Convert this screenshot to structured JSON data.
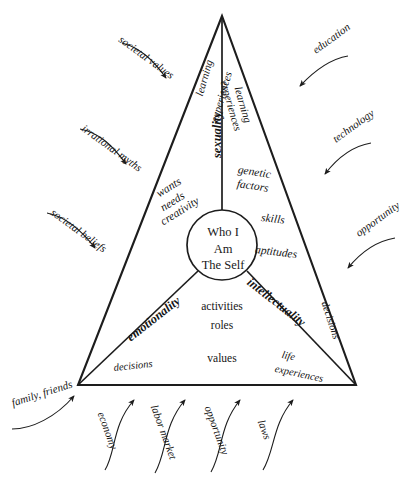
{
  "diagram": {
    "title": "Who I Am The Self",
    "type": "triangle-influence-diagram",
    "colors": {
      "line": "#1d1d1d",
      "text": "#151515",
      "background": "#ffffff"
    },
    "center": {
      "line1": "Who I",
      "line2": "Am",
      "line3": "The Self"
    },
    "domains": [
      {
        "id": "sexuality",
        "label": "sexuality"
      },
      {
        "id": "emotionality",
        "label": "emotionality"
      },
      {
        "id": "intellectuality",
        "label": "intellectuality"
      }
    ],
    "sector_top_left": {
      "learning": "learning",
      "experiences": "experiences",
      "wants": "wants",
      "needs": "needs",
      "creativity": "creativity"
    },
    "sector_top_right": {
      "learning": "learning",
      "experiences": "experiences",
      "genetic": "genetic",
      "factors": "factors",
      "skills": "skills",
      "aptitudes": "aptitudes"
    },
    "sector_bottom": {
      "activities": "activities",
      "roles": "roles",
      "values": "values",
      "decisions_left": "decisions",
      "decisions_right": "decisions",
      "life": "life",
      "experiences": "experiences"
    },
    "influences_left": [
      {
        "label": "societal values"
      },
      {
        "label": "irrational myths"
      },
      {
        "label": "societal beliefs"
      }
    ],
    "influences_right": [
      {
        "label": "education"
      },
      {
        "label": "technology"
      },
      {
        "label": "opportunity"
      }
    ],
    "influences_bottom": [
      {
        "label": "family, friends"
      },
      {
        "label": "economy"
      },
      {
        "label": "labor market"
      },
      {
        "label": "opportunity"
      },
      {
        "label": "laws"
      }
    ]
  }
}
